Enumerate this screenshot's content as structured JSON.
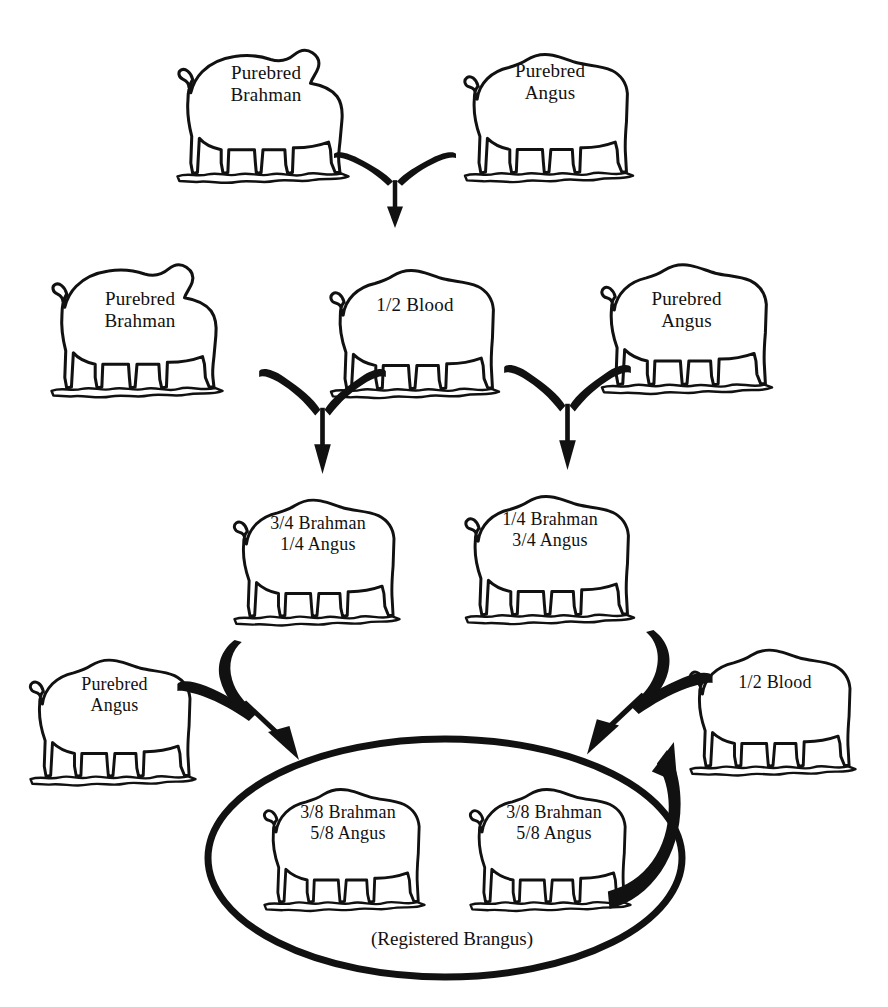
{
  "diagram": {
    "ink_color": "#111111",
    "background_color": "#ffffff",
    "generations": [
      {
        "row": 1,
        "animals": [
          {
            "id": "g1-brahman",
            "label": "Purebred\nBrahman",
            "breed": "brahman",
            "x": 168,
            "y": 28,
            "w": 190,
            "h": 175,
            "label_x": 196,
            "label_y": 62,
            "label_w": 140,
            "font": 19
          },
          {
            "id": "g1-angus",
            "label": "Purebred\nAngus",
            "breed": "angus",
            "x": 455,
            "y": 32,
            "w": 188,
            "h": 168,
            "label_x": 480,
            "label_y": 60,
            "label_w": 140,
            "font": 19
          }
        ]
      },
      {
        "row": 2,
        "animals": [
          {
            "id": "g2-brahman",
            "label": "Purebred\nBrahman",
            "breed": "brahman",
            "x": 42,
            "y": 244,
            "w": 190,
            "h": 172,
            "label_x": 70,
            "label_y": 288,
            "label_w": 140,
            "font": 19
          },
          {
            "id": "g2-half",
            "label": "1/2 Blood",
            "breed": "angus",
            "x": 320,
            "y": 248,
            "w": 190,
            "h": 168,
            "label_x": 340,
            "label_y": 294,
            "label_w": 150,
            "font": 19
          },
          {
            "id": "g2-angus",
            "label": "Purebred\nAngus",
            "breed": "angus",
            "x": 592,
            "y": 242,
            "w": 190,
            "h": 170,
            "label_x": 614,
            "label_y": 288,
            "label_w": 145,
            "font": 19
          }
        ]
      },
      {
        "row": 3,
        "animals": [
          {
            "id": "g3-left",
            "label": "3/4 Brahman\n1/4 Angus",
            "breed": "angus",
            "x": 222,
            "y": 478,
            "w": 190,
            "h": 165,
            "label_x": 238,
            "label_y": 513,
            "label_w": 160,
            "font": 18
          },
          {
            "id": "g3-right",
            "label": "1/4 Brahman\n3/4 Angus",
            "breed": "angus",
            "x": 455,
            "y": 474,
            "w": 190,
            "h": 168,
            "label_x": 470,
            "label_y": 509,
            "label_w": 160,
            "font": 18
          }
        ]
      },
      {
        "row": 4,
        "animals": [
          {
            "id": "g4-angus",
            "label": "Purebred\nAngus",
            "breed": "angus",
            "x": 18,
            "y": 638,
            "w": 190,
            "h": 165,
            "label_x": 42,
            "label_y": 674,
            "label_w": 145,
            "font": 18
          },
          {
            "id": "g4-half",
            "label": "1/2 Blood",
            "breed": "angus",
            "x": 678,
            "y": 628,
            "w": 190,
            "h": 165,
            "label_x": 700,
            "label_y": 672,
            "label_w": 150,
            "font": 18
          }
        ]
      },
      {
        "row": 5,
        "animals": [
          {
            "id": "g5-left",
            "label": "3/8 Brahman\n5/8 Angus",
            "breed": "angus",
            "x": 252,
            "y": 768,
            "w": 185,
            "h": 160,
            "label_x": 268,
            "label_y": 802,
            "label_w": 160,
            "font": 18
          },
          {
            "id": "g5-right",
            "label": "3/8 Brahman\n5/8 Angus",
            "breed": "angus",
            "x": 458,
            "y": 768,
            "w": 185,
            "h": 160,
            "label_x": 474,
            "label_y": 802,
            "label_w": 160,
            "font": 18
          }
        ]
      }
    ],
    "oval": {
      "caption": "(Registered Brangus)",
      "caption_x": 282,
      "caption_y": 928,
      "caption_w": 340,
      "caption_font": 19,
      "cx": 445,
      "cy": 858,
      "rx": 237,
      "ry": 119,
      "stroke_width": 7
    },
    "arrows": [
      {
        "id": "merge-gen1",
        "type": "merge-down",
        "x": 330,
        "y": 140,
        "w": 130,
        "h": 90,
        "note": "Purebred Brahman x Purebred Angus -> 1/2 Blood"
      },
      {
        "id": "merge-gen2-left",
        "type": "merge-down",
        "x": 255,
        "y": 352,
        "w": 135,
        "h": 125,
        "note": "Purebred Brahman x 1/2 Blood -> 3/4 Brahman 1/4 Angus"
      },
      {
        "id": "merge-gen2-right",
        "type": "merge-down",
        "x": 500,
        "y": 348,
        "w": 135,
        "h": 125,
        "note": "1/2 Blood x Purebred Angus -> 1/4 Brahman 3/4 Angus"
      },
      {
        "id": "merge-gen3-left",
        "type": "merge-diag-right",
        "x": 175,
        "y": 640,
        "w": 155,
        "h": 130,
        "note": "Purebred Angus x 3/4 Brahman -> 3/8 Brahman 5/8 Angus"
      },
      {
        "id": "merge-gen3-right",
        "type": "merge-diag-left",
        "x": 555,
        "y": 630,
        "w": 160,
        "h": 135,
        "note": "1/4 Brahman 3/4 Angus x 1/2 Blood -> 3/8 Brahman 5/8 Angus"
      },
      {
        "id": "brangus-mating-arc",
        "type": "arc-right",
        "x": 596,
        "y": 742,
        "w": 110,
        "h": 175,
        "note": "Brangus x Brangus mating arc"
      }
    ]
  }
}
